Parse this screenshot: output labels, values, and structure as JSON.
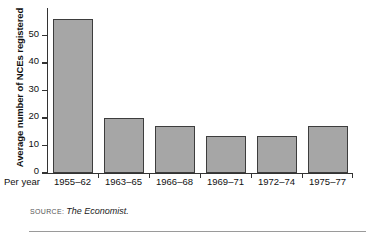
{
  "chart_data": {
    "type": "bar",
    "title": "",
    "subtitle": "",
    "xlabel": "Per year",
    "ylabel": "Average number of NCEs registered",
    "categories": [
      "1955–62",
      "1963–65",
      "1966–68",
      "1969–71",
      "1972–74",
      "1975–77"
    ],
    "values": [
      56,
      20,
      17,
      13.5,
      13.5,
      17
    ],
    "ylim": [
      0,
      60
    ],
    "yticks": [
      0,
      10,
      20,
      30,
      40,
      50
    ],
    "ytick_labels": [
      "0",
      "10",
      "20",
      "30",
      "40",
      "50"
    ],
    "grid": false,
    "legend": null,
    "legend_position": "none",
    "bar_fill_color": "#a6a6a6",
    "bar_edge_color": "#3d3d3d",
    "axis_color": "#333333",
    "background_color": "#ffffff"
  },
  "source": {
    "label": "SOURCE:",
    "value": "The Economist."
  }
}
